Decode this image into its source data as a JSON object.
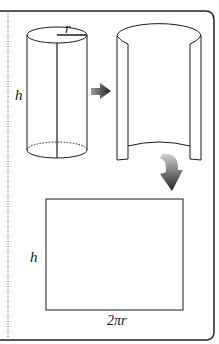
{
  "diagram": {
    "cylinder": {
      "radius_label": "r",
      "height_label": "h"
    },
    "unrolled_tube": {
      "description": "open cylinder being unrolled"
    },
    "rectangle": {
      "height_label": "h",
      "width_label": "2πr"
    },
    "arrows": [
      "straight-arrow",
      "curved-arrow"
    ],
    "colors": {
      "stroke": "#1a1a1a",
      "arrow_dark": "#333333",
      "arrow_light": "#bbbbbb",
      "background": "#ffffff"
    }
  }
}
